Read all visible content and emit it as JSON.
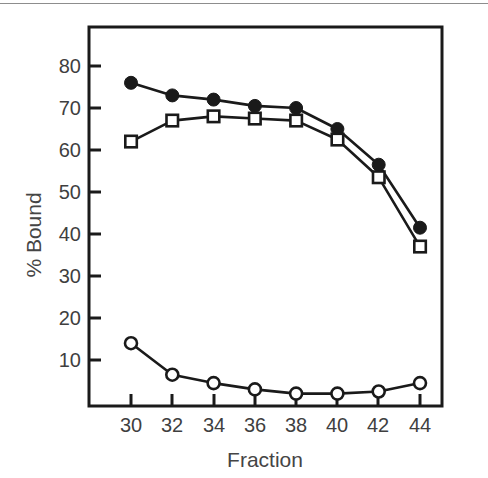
{
  "chart_data": {
    "type": "line",
    "title": "",
    "xlabel": "Fraction",
    "ylabel": "% Bound",
    "x": [
      30,
      32,
      34,
      36,
      38,
      40,
      42,
      44
    ],
    "xticklabels": [
      "30",
      "32",
      "34",
      "36",
      "38",
      "40",
      "42",
      "44"
    ],
    "yticklabels": [
      "10",
      "20",
      "30",
      "40",
      "50",
      "60",
      "70",
      "80"
    ],
    "yticks": [
      10,
      20,
      30,
      40,
      50,
      60,
      70,
      80
    ],
    "xlim": [
      28.8,
      45.2
    ],
    "ylim": [
      0,
      85
    ],
    "grid": false,
    "legend": "none",
    "series": [
      {
        "name": "filled-circle-series",
        "marker": "filled-circle",
        "color": "#1a1a1a",
        "values": [
          76,
          73,
          72,
          70.5,
          70,
          65,
          56.5,
          41.5
        ]
      },
      {
        "name": "open-square-series",
        "marker": "open-square",
        "color": "#1a1a1a",
        "values": [
          62,
          67,
          68,
          67.5,
          67,
          62.5,
          53.5,
          37
        ]
      },
      {
        "name": "open-circle-series",
        "marker": "open-circle",
        "color": "#1a1a1a",
        "values": [
          14,
          6.5,
          4.5,
          3,
          2,
          2,
          2.5,
          4.5
        ]
      }
    ]
  },
  "axes": {
    "x_title": "Fraction",
    "y_title": "% Bound"
  },
  "colors": {
    "axis": "#1a1a1a",
    "text": "#3f3f3f",
    "marker_fill": "#1a1a1a",
    "marker_open": "#ffffff",
    "scan_rule": "#8d8d8d"
  }
}
